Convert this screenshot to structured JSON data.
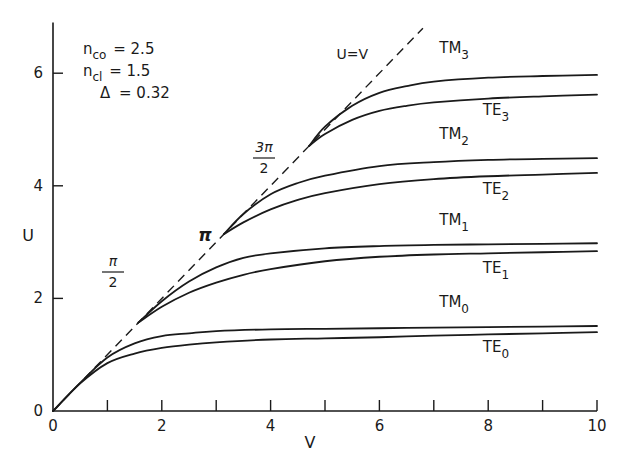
{
  "chart_data": {
    "type": "line",
    "title": "",
    "xlabel": "V",
    "ylabel": "U",
    "xlim": [
      0,
      10
    ],
    "ylim": [
      0,
      6.9
    ],
    "grid": false,
    "x_ticks_major": [
      0,
      2,
      4,
      6,
      8,
      10
    ],
    "x_ticks_minor": [
      1,
      3,
      5,
      7,
      9
    ],
    "y_ticks": [
      0,
      2,
      4,
      6
    ],
    "x_tick_labels": [
      "0",
      "2",
      "4",
      "6",
      "8",
      "10"
    ],
    "y_tick_labels": [
      "0",
      "2",
      "4",
      "6"
    ],
    "parameters": [
      {
        "symbol": "n",
        "sub": "co",
        "value": "= 2.5"
      },
      {
        "symbol": "n",
        "sub": "cl",
        "value": "= 1.5"
      },
      {
        "symbol": "Δ",
        "sub": "",
        "value": "= 0.32"
      }
    ],
    "reference_line": {
      "name": "U=V",
      "label": "U=V",
      "x": [
        0,
        6.8
      ],
      "y": [
        0,
        6.8
      ],
      "style": "dashed"
    },
    "cutoff_labels": [
      {
        "label": "π/2",
        "num": "π",
        "den": "2",
        "V": 1.57
      },
      {
        "label": "π",
        "V": 3.14
      },
      {
        "label": "3π/2",
        "num": "3π",
        "den": "2",
        "V": 4.71
      }
    ],
    "series": [
      {
        "name": "TM0",
        "base": "TM",
        "sub": "0",
        "x": [
          0,
          0.5,
          1,
          1.5,
          2,
          2.5,
          3,
          4,
          5,
          6,
          7,
          8,
          9,
          10
        ],
        "y": [
          0,
          0.5,
          0.95,
          1.2,
          1.33,
          1.38,
          1.42,
          1.45,
          1.46,
          1.47,
          1.48,
          1.49,
          1.5,
          1.51
        ]
      },
      {
        "name": "TE0",
        "base": "TE",
        "sub": "0",
        "x": [
          0,
          0.5,
          1,
          1.5,
          2,
          2.5,
          3,
          4,
          5,
          6,
          7,
          8,
          9,
          10
        ],
        "y": [
          0,
          0.49,
          0.85,
          1.02,
          1.12,
          1.18,
          1.22,
          1.27,
          1.29,
          1.31,
          1.34,
          1.36,
          1.38,
          1.4
        ]
      },
      {
        "name": "TM1",
        "base": "TM",
        "sub": "1",
        "x": [
          1.57,
          2,
          2.5,
          3,
          3.5,
          4,
          5,
          6,
          7,
          8,
          9,
          10
        ],
        "y": [
          1.57,
          1.95,
          2.3,
          2.55,
          2.72,
          2.8,
          2.89,
          2.93,
          2.95,
          2.96,
          2.97,
          2.98
        ]
      },
      {
        "name": "TE1",
        "base": "TE",
        "sub": "1",
        "x": [
          1.57,
          2,
          2.5,
          3,
          3.5,
          4,
          5,
          6,
          7,
          8,
          9,
          10
        ],
        "y": [
          1.57,
          1.85,
          2.1,
          2.28,
          2.42,
          2.52,
          2.66,
          2.74,
          2.78,
          2.8,
          2.82,
          2.84
        ]
      },
      {
        "name": "TM2",
        "base": "TM",
        "sub": "2",
        "x": [
          3.14,
          3.5,
          4,
          4.5,
          5,
          6,
          7,
          8,
          9,
          10
        ],
        "y": [
          3.14,
          3.5,
          3.85,
          4.05,
          4.18,
          4.35,
          4.42,
          4.46,
          4.48,
          4.49
        ]
      },
      {
        "name": "TE2",
        "base": "TE",
        "sub": "2",
        "x": [
          3.14,
          3.5,
          4,
          4.5,
          5,
          6,
          7,
          8,
          9,
          10
        ],
        "y": [
          3.14,
          3.35,
          3.58,
          3.75,
          3.87,
          4.03,
          4.12,
          4.17,
          4.2,
          4.23
        ]
      },
      {
        "name": "TM3",
        "base": "TM",
        "sub": "3",
        "x": [
          4.71,
          5,
          5.5,
          6,
          6.5,
          7,
          8,
          9,
          10
        ],
        "y": [
          4.71,
          5.05,
          5.42,
          5.65,
          5.77,
          5.85,
          5.92,
          5.95,
          5.97
        ]
      },
      {
        "name": "TE3",
        "base": "TE",
        "sub": "3",
        "x": [
          4.71,
          5,
          5.5,
          6,
          6.5,
          7,
          8,
          9,
          10
        ],
        "y": [
          4.71,
          4.92,
          5.17,
          5.33,
          5.42,
          5.48,
          5.55,
          5.59,
          5.62
        ]
      }
    ],
    "series_label_positions": {
      "TM3": [
        7.1,
        6.35
      ],
      "TE3": [
        7.9,
        5.25
      ],
      "TM2": [
        7.1,
        4.83
      ],
      "TE2": [
        7.9,
        3.85
      ],
      "TM1": [
        7.1,
        3.3
      ],
      "TE1": [
        7.9,
        2.45
      ],
      "TM0": [
        7.1,
        1.85
      ],
      "TE0": [
        7.9,
        1.05
      ]
    }
  }
}
